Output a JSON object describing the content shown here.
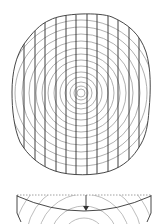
{
  "diagram": {
    "colors": {
      "outline": "#333333",
      "vertical_lines": "#2b2b2b",
      "rings": "#9a9a9a",
      "dashed": "#888888",
      "background": "#ffffff"
    },
    "plan_view": {
      "center": [
        81,
        93
      ],
      "ring_radii": [
        4,
        7,
        11,
        16,
        21,
        27,
        33,
        39,
        45,
        52,
        59,
        66,
        73
      ],
      "vertical_line_x": [
        24,
        35,
        45,
        56,
        66,
        76,
        87,
        97,
        108,
        118,
        129,
        139
      ]
    },
    "section_view": {
      "dashed_line_y": 195,
      "arrow": "down-arrow"
    }
  }
}
